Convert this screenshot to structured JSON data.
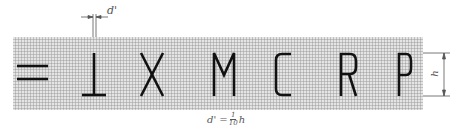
{
  "diagram": {
    "letters": [
      "=",
      "⊥",
      "X",
      "M",
      "C",
      "R",
      "P"
    ],
    "stroke_label": "d'",
    "height_label": "h",
    "formula": {
      "prefix": "d' =",
      "numerator": "1",
      "denominator": "10",
      "suffix": "h"
    },
    "colors": {
      "grid_bg": "#d8d8d8",
      "grid_line": "#8a8a8a",
      "stroke": "#111111",
      "annotation": "#555555"
    }
  }
}
